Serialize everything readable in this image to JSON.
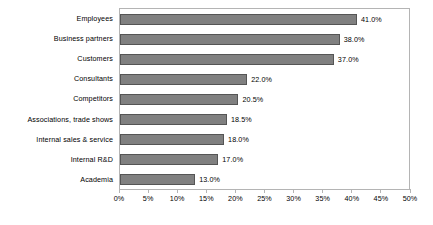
{
  "chart_data": {
    "type": "bar",
    "orientation": "horizontal",
    "title": "",
    "subtitle": "",
    "xlabel": "",
    "ylabel": "",
    "xlim": [
      0,
      50
    ],
    "grid": false,
    "legend": null,
    "bar_color": "#808080",
    "bar_border_color": "#555555",
    "plot_border_color": "#b4b4b4",
    "background_color": "#ffffff",
    "tick_step": 5,
    "categories": [
      "Employees",
      "Business partners",
      "Customers",
      "Consultants",
      "Competitors",
      "Associations, trade shows",
      "Internal sales & service",
      "Internal R&D",
      "Academia"
    ],
    "values": [
      41.0,
      38.0,
      37.0,
      22.0,
      20.5,
      18.5,
      18.0,
      17.0,
      13.0
    ],
    "data_labels": [
      "41.0%",
      "38.0%",
      "37.0%",
      "22.0%",
      "20.5%",
      "18.5%",
      "18.0%",
      "17.0%",
      "13.0%"
    ],
    "xticks": [
      0,
      5,
      10,
      15,
      20,
      25,
      30,
      35,
      40,
      45,
      50
    ],
    "xticklabels": [
      "0%",
      "5%",
      "10%",
      "15%",
      "20%",
      "25%",
      "30%",
      "35%",
      "40%",
      "45%",
      "50%"
    ]
  }
}
